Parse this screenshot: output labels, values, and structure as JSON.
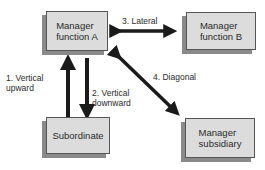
{
  "diagram": {
    "nodes": [
      {
        "id": "manager-a",
        "label": "Manager\nfunction A"
      },
      {
        "id": "manager-b",
        "label": "Manager\nfunction B"
      },
      {
        "id": "subordinate",
        "label": "Subordinate"
      },
      {
        "id": "manager-subsidiary",
        "label": "Manager\nsubsidiary"
      }
    ],
    "edges": [
      {
        "id": "vertical-upward",
        "label": "1.  Vertical\n     upward",
        "from": "subordinate",
        "to": "manager-a"
      },
      {
        "id": "vertical-downward",
        "label": "2.  Vertical\n     downward",
        "from": "manager-a",
        "to": "subordinate"
      },
      {
        "id": "lateral",
        "label": "3.  Lateral",
        "from": "manager-a",
        "to": "manager-b"
      },
      {
        "id": "diagonal",
        "label": "4.  Diagonal",
        "from": "manager-a",
        "to": "manager-subsidiary"
      }
    ],
    "colors": {
      "box_fill": "#dcdcdc",
      "box_shadow": "#8a8a8a",
      "arrow": "#1a1a1a"
    }
  }
}
